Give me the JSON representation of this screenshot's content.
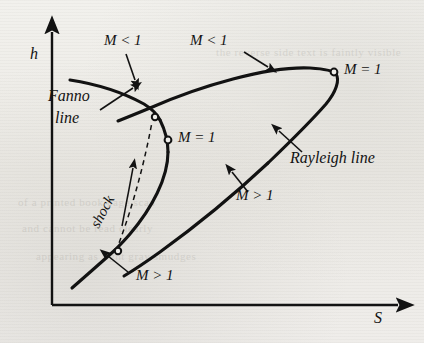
{
  "figure": {
    "type": "h-s thermodynamic diagram",
    "axes": {
      "y_label": "h",
      "x_label": "S"
    },
    "curves": [
      {
        "name": "Fanno line",
        "label": "Fanno line",
        "label_line1": "Fanno",
        "label_line2": "line"
      },
      {
        "name": "Rayleigh line",
        "label": "Rayleigh line"
      }
    ],
    "annotations": {
      "fanno_subsonic": "M < 1",
      "rayleigh_subsonic": "M < 1",
      "rayleigh_sonic": "M = 1",
      "fanno_sonic": "M = 1",
      "rayleigh_supersonic": "M > 1",
      "fanno_supersonic": "M > 1",
      "shock": "shock"
    },
    "markers": [
      {
        "name": "rayleigh-sonic-point",
        "label": "M = 1"
      },
      {
        "name": "fanno-sonic-point",
        "label": "M = 1"
      },
      {
        "name": "upper-intersection-point",
        "label": ""
      },
      {
        "name": "lower-intersection-point",
        "label": ""
      }
    ],
    "colors": {
      "ink": "#121212",
      "paper": "#efeeea"
    }
  },
  "background_showthrough": [
    "the reverse side text is faintly visible",
    "of a printed book page scan",
    "and cannot be read clearly",
    "appearing as light gray smudges"
  ]
}
